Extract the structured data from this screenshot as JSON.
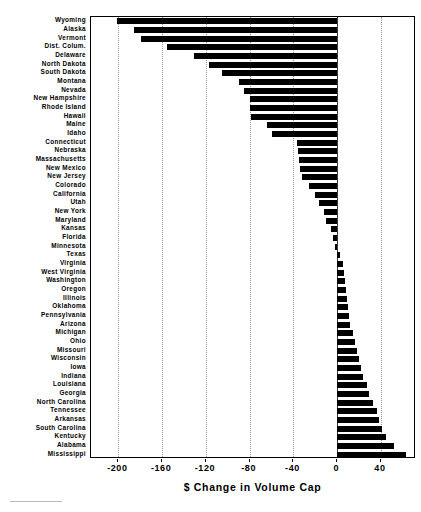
{
  "chart_data": {
    "type": "bar",
    "orientation": "horizontal",
    "title": "",
    "xlabel": "$ Change in Volume Cap",
    "ylabel": "",
    "xlim": [
      -225,
      72
    ],
    "xticks": [
      -200,
      -160,
      -120,
      -80,
      -40,
      0,
      40
    ],
    "xticklabels": [
      "-200",
      "-160",
      "-120",
      "-80",
      "-40",
      "0",
      "40"
    ],
    "grid": "vertical-dotted",
    "legend": "none",
    "bar_color": "#000000",
    "categories": [
      "Wyoming",
      "Alaska",
      "Vermont",
      "Dist. Colum.",
      "Delaware",
      "North Dakota",
      "South Dakota",
      "Montana",
      "Nevada",
      "New Hampshire",
      "Rhode Island",
      "Hawaii",
      "Maine",
      "Idaho",
      "Connecticut",
      "Nebraska",
      "Massachusetts",
      "New Mexico",
      "New Jersey",
      "Colorado",
      "California",
      "Utah",
      "New York",
      "Maryland",
      "Kansas",
      "Florida",
      "Minnesota",
      "Texas",
      "Virginia",
      "West Virginia",
      "Washington",
      "Oregon",
      "Illinois",
      "Oklahoma",
      "Pennsylvania",
      "Arizona",
      "Michigan",
      "Ohio",
      "Missouri",
      "Wisconsin",
      "Iowa",
      "Indiana",
      "Louisiana",
      "Georgia",
      "North Carolina",
      "Tennessee",
      "Arkansas",
      "South Carolina",
      "Kentucky",
      "Alabama",
      "Mississippi"
    ],
    "values": [
      -201,
      -186,
      -179,
      -156,
      -131,
      -117,
      -105,
      -90,
      -85,
      -80,
      -80,
      -79,
      -64,
      -60,
      -37,
      -36,
      -35,
      -34,
      -32,
      -26,
      -20,
      -17,
      -12,
      -10,
      -6,
      -4,
      -2,
      3,
      5,
      6,
      7,
      8,
      9,
      10,
      11,
      12,
      14,
      16,
      18,
      20,
      22,
      24,
      27,
      29,
      33,
      36,
      38,
      41,
      45,
      52,
      63
    ]
  },
  "footer": {
    "rule": ""
  }
}
